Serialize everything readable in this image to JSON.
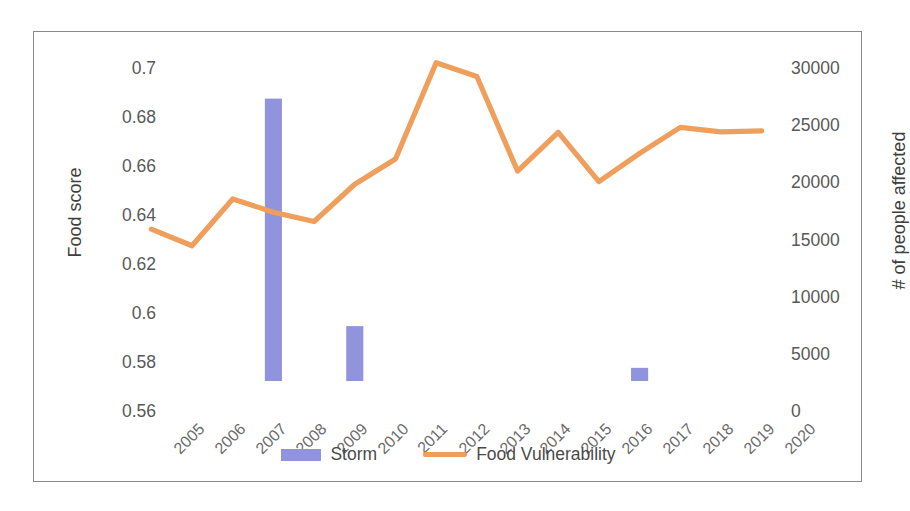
{
  "chart_data": {
    "type": "bar",
    "title": "",
    "xlabel": "",
    "categories": [
      "2005",
      "2006",
      "2007",
      "2008",
      "2009",
      "2010",
      "2011",
      "2012",
      "2013",
      "2014",
      "2015",
      "2016",
      "2017",
      "2018",
      "2019",
      "2020"
    ],
    "grid": false,
    "legend_position": "bottom",
    "axes": {
      "left": {
        "label": "Food score",
        "min": 0.56,
        "max": 0.7,
        "step": 0.02,
        "ticks": [
          "0.56",
          "0.58",
          "0.6",
          "0.62",
          "0.64",
          "0.66",
          "0.68",
          "0.7"
        ],
        "tick_values": [
          0.56,
          0.58,
          0.6,
          0.62,
          0.64,
          0.66,
          0.68,
          0.7
        ]
      },
      "right": {
        "label": "# of people affected",
        "min": 0,
        "max": 30000,
        "step": 5000,
        "ticks": [
          "0",
          "5000",
          "10000",
          "15000",
          "20000",
          "25000",
          "30000"
        ],
        "tick_values": [
          0,
          5000,
          10000,
          15000,
          20000,
          25000,
          30000
        ]
      }
    },
    "series": [
      {
        "name": "Storm",
        "type": "bar",
        "axis": "right",
        "color": "#8f94dd",
        "values": [
          0,
          0,
          0,
          24700,
          0,
          4800,
          0,
          0,
          0,
          0,
          0,
          0,
          1150,
          0,
          0,
          0
        ]
      },
      {
        "name": "Food Vulnerability",
        "type": "line",
        "axis": "left",
        "color": "#ef9f5b",
        "values": [
          0.622,
          0.6152,
          0.6343,
          0.6289,
          0.6251,
          0.6403,
          0.6506,
          0.6899,
          0.6843,
          0.6457,
          0.6615,
          0.6414,
          0.6529,
          0.6635,
          0.6617,
          0.6621
        ]
      }
    ]
  },
  "legend": {
    "items": [
      {
        "label": "Storm",
        "marker": "bar-swatch",
        "color": "#8f94dd"
      },
      {
        "label": "Food Vulnerability",
        "marker": "line-swatch",
        "color": "#ef9f5b"
      }
    ]
  }
}
